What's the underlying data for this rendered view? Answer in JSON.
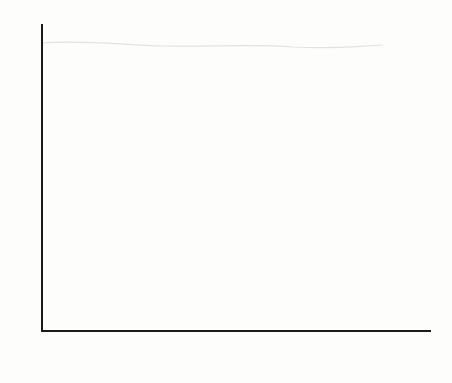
{
  "chart_data": {
    "type": "bar",
    "title": "",
    "xlabel": "",
    "ylabel": "",
    "ylim": [
      0,
      100
    ],
    "yticks": [
      0,
      10,
      20,
      30,
      40,
      50,
      60,
      70,
      80,
      90,
      100
    ],
    "ytick_labels": [
      "0",
      "10",
      "20",
      "30",
      "40",
      "50",
      "60",
      "70",
      "80",
      "90",
      "100"
    ],
    "grid": false,
    "legend_position": "right",
    "legend_title": "Legend",
    "categories": [
      "Less than\nhigh school",
      "High\nschool",
      "Some\ncollege",
      "College\ndegree"
    ],
    "series": [
      {
        "name": "1952–60",
        "values": [
          66,
          82,
          86.5,
          90.5
        ],
        "fill": "fill-a",
        "color": "#8e8e8e"
      },
      {
        "name": "1964–88",
        "values": [
          60,
          69.5,
          79.5,
          89
        ],
        "fill": "fill-b",
        "color": "#e4e4e0"
      },
      {
        "name": "1992",
        "values": [
          50,
          72.5,
          84.5,
          91
        ],
        "fill": "fill-c",
        "color": "#3a3a3a"
      }
    ]
  },
  "axis": {
    "line_color": "#1b1b1b"
  }
}
